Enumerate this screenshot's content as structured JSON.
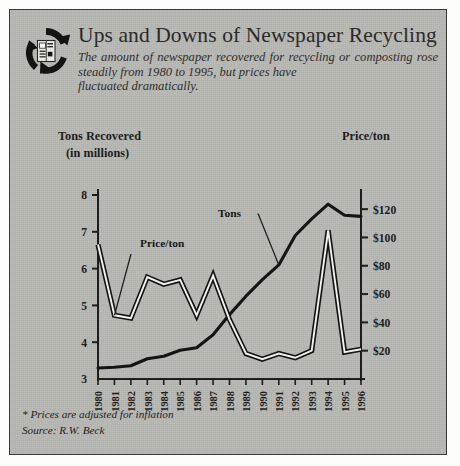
{
  "header": {
    "title": "Ups and Downs of Newspaper Recycling",
    "subtitle_line1": "The amount of newspaper recovered for recycling or",
    "subtitle_line2": "composting rose steadily from 1980 to 1995, but prices have",
    "subtitle_line3": "fluctuated dramatically.",
    "logo_icon": "recycling-newspaper-icon"
  },
  "footnotes": {
    "inflation_note": "* Prices are adjusted for inflation",
    "source": "Source: R.W. Beck"
  },
  "colors": {
    "panel_background": "#b9b9b4",
    "border": "#3a3a38",
    "ink": "#1d1d1b",
    "tons_line": "#151513",
    "price_line_outline": "#151513",
    "price_line_fill": "#f2f2ee"
  },
  "chart_data": {
    "type": "line",
    "title": "Ups and Downs of Newspaper Recycling",
    "xlabel": "",
    "grid": false,
    "legend": "inline-annotations",
    "x": [
      1980,
      1981,
      1982,
      1983,
      1984,
      1985,
      1986,
      1987,
      1988,
      1989,
      1990,
      1991,
      1992,
      1993,
      1994,
      1995,
      1996
    ],
    "xtick_labels": [
      "1980",
      "1981",
      "1982",
      "1983",
      "1984",
      "1985",
      "1986",
      "1987",
      "1988",
      "1989",
      "1990",
      "1991",
      "1992",
      "1993",
      "1994",
      "1995",
      "1996"
    ],
    "axes": [
      {
        "id": "left",
        "title_line1": "Tons Recovered",
        "title_line2": "(in millions)",
        "ylim": [
          3,
          8
        ],
        "ticks": [
          3,
          4,
          5,
          6,
          7,
          8
        ],
        "tick_labels": [
          "3",
          "4",
          "5",
          "6",
          "7",
          "8"
        ]
      },
      {
        "id": "right",
        "title": "Price/ton",
        "ylim": [
          0,
          130
        ],
        "ticks": [
          20,
          40,
          60,
          80,
          100,
          120
        ],
        "tick_labels": [
          "$20",
          "$40",
          "$60",
          "$80",
          "$100",
          "$120"
        ]
      }
    ],
    "series": [
      {
        "name": "Tons",
        "label": "Tons",
        "axis": "left",
        "unit": "millions of tons",
        "style": "solid-thick",
        "values": [
          3.3,
          3.32,
          3.36,
          3.55,
          3.62,
          3.78,
          3.85,
          4.2,
          4.75,
          5.25,
          5.7,
          6.1,
          6.9,
          7.35,
          7.75,
          7.45,
          7.42
        ]
      },
      {
        "name": "Price/ton",
        "label": "Price/ton",
        "axis": "right",
        "unit": "dollars per ton",
        "style": "outlined-double",
        "values": [
          95,
          45,
          43,
          72,
          67,
          70,
          45,
          73,
          42,
          18,
          14,
          18,
          15,
          20,
          105,
          19,
          21
        ]
      }
    ],
    "annotations": [
      {
        "text": "Price/ton",
        "series": "Price/ton",
        "points_to_year": 1981
      },
      {
        "text": "Tons",
        "series": "Tons",
        "points_to_year": 1991
      }
    ]
  }
}
